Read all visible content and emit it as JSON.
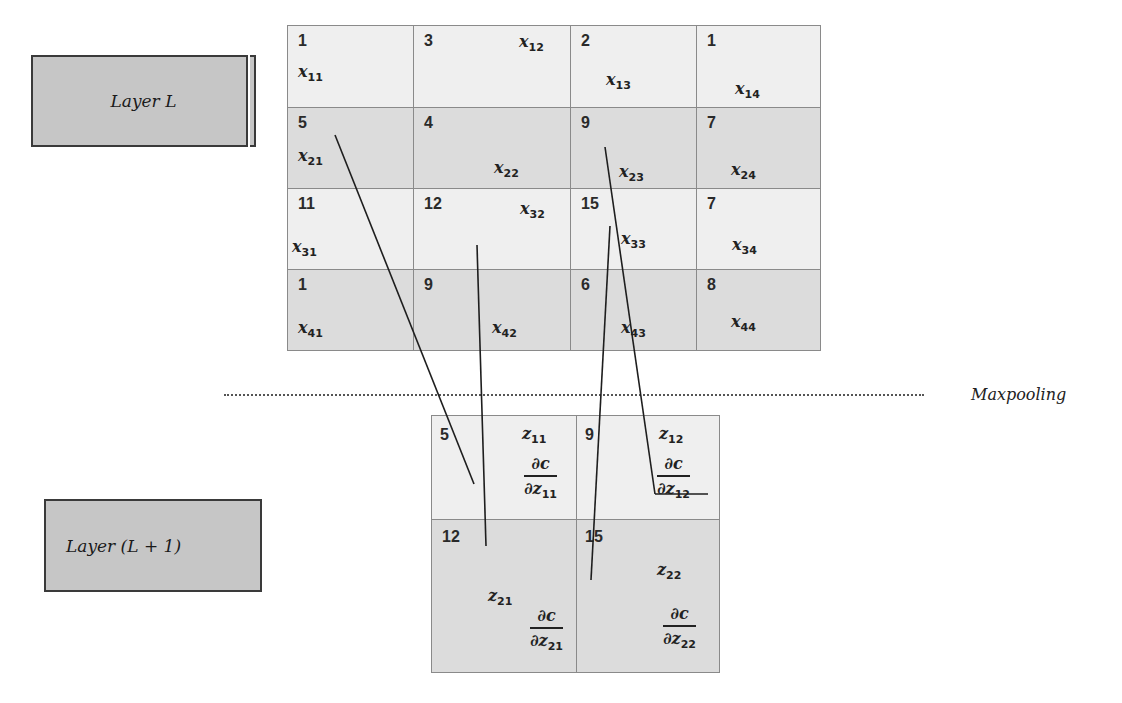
{
  "layers": {
    "input_label": "Layer L",
    "output_label": "Layer (L + 1)"
  },
  "operation_label": "Maxpooling",
  "input_grid": {
    "rows": [
      [
        {
          "value": "1",
          "var": "x",
          "sub": "11"
        },
        {
          "value": "3",
          "var": "x",
          "sub": "12"
        },
        {
          "value": "2",
          "var": "x",
          "sub": "13"
        },
        {
          "value": "1",
          "var": "x",
          "sub": "14"
        }
      ],
      [
        {
          "value": "5",
          "var": "x",
          "sub": "21"
        },
        {
          "value": "4",
          "var": "x",
          "sub": "22"
        },
        {
          "value": "9",
          "var": "x",
          "sub": "23"
        },
        {
          "value": "7",
          "var": "x",
          "sub": "24"
        }
      ],
      [
        {
          "value": "11",
          "var": "x",
          "sub": "31"
        },
        {
          "value": "12",
          "var": "x",
          "sub": "32"
        },
        {
          "value": "15",
          "var": "x",
          "sub": "33"
        },
        {
          "value": "7",
          "var": "x",
          "sub": "34"
        }
      ],
      [
        {
          "value": "1",
          "var": "x",
          "sub": "41"
        },
        {
          "value": "9",
          "var": "x",
          "sub": "42"
        },
        {
          "value": "6",
          "var": "x",
          "sub": "43"
        },
        {
          "value": "8",
          "var": "x",
          "sub": "44"
        }
      ]
    ]
  },
  "output_grid": {
    "rows": [
      [
        {
          "value": "5",
          "var": "z",
          "sub": "11",
          "grad_num": "∂c",
          "grad_den": "∂z",
          "grad_sub": "11"
        },
        {
          "value": "9",
          "var": "z",
          "sub": "12",
          "grad_num": "∂c",
          "grad_den": "∂z",
          "grad_sub": "12"
        }
      ],
      [
        {
          "value": "12",
          "var": "z",
          "sub": "21",
          "grad_num": "∂c",
          "grad_den": "∂z",
          "grad_sub": "21"
        },
        {
          "value": "15",
          "var": "z",
          "sub": "22",
          "grad_num": "∂c",
          "grad_den": "∂z",
          "grad_sub": "22"
        }
      ]
    ]
  },
  "connections": [
    {
      "from": "x21",
      "to": "z11"
    },
    {
      "from": "x32",
      "to": "z21"
    },
    {
      "from": "x23",
      "to": "z12"
    },
    {
      "from": "x33",
      "to": "z22"
    }
  ],
  "colors": {
    "layer_box": "#c6c6c6",
    "cell_light": "#efefef",
    "cell_dark": "#dcdcdc",
    "border": "#8a8a8a"
  }
}
